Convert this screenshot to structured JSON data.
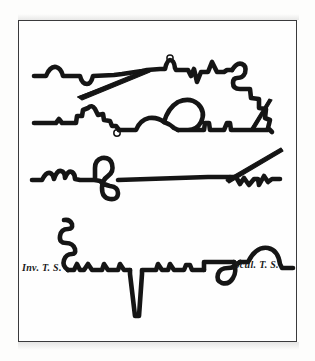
{
  "plate": {
    "background_color": "#fdfdfc",
    "frame_color": "#3a3a3c",
    "ink_color": "#151515",
    "description": "Engraved plate showing four horizontal profile traces",
    "captions": {
      "left": "Inv. T. S.",
      "right": "Scul. T. S."
    },
    "figures": [
      {
        "name": "trace-row-1",
        "features": [
          "low bumps",
          "dip notch",
          "long thin descending wedge",
          "small knot loop",
          "narrow spikes",
          "stepped zigzag descent at right"
        ]
      },
      {
        "name": "trace-row-2",
        "features": [
          "crown cluster bump",
          "small pendant loop below baseline",
          "large rounded arch balloon",
          "low spikes",
          "thin rising wedge at right"
        ]
      },
      {
        "name": "trace-row-3",
        "features": [
          "cluster of rounded bumps",
          "S-shaped double loop crossing baseline",
          "long flat baseline",
          "thin rising wedge at right",
          "small zigzag teeth"
        ]
      },
      {
        "name": "trace-row-4",
        "features": [
          "descending coil spiral at left",
          "deep narrow downward spike",
          "stepped plateaus",
          "pendant teardrop loop",
          "dome arch at right"
        ]
      }
    ]
  }
}
